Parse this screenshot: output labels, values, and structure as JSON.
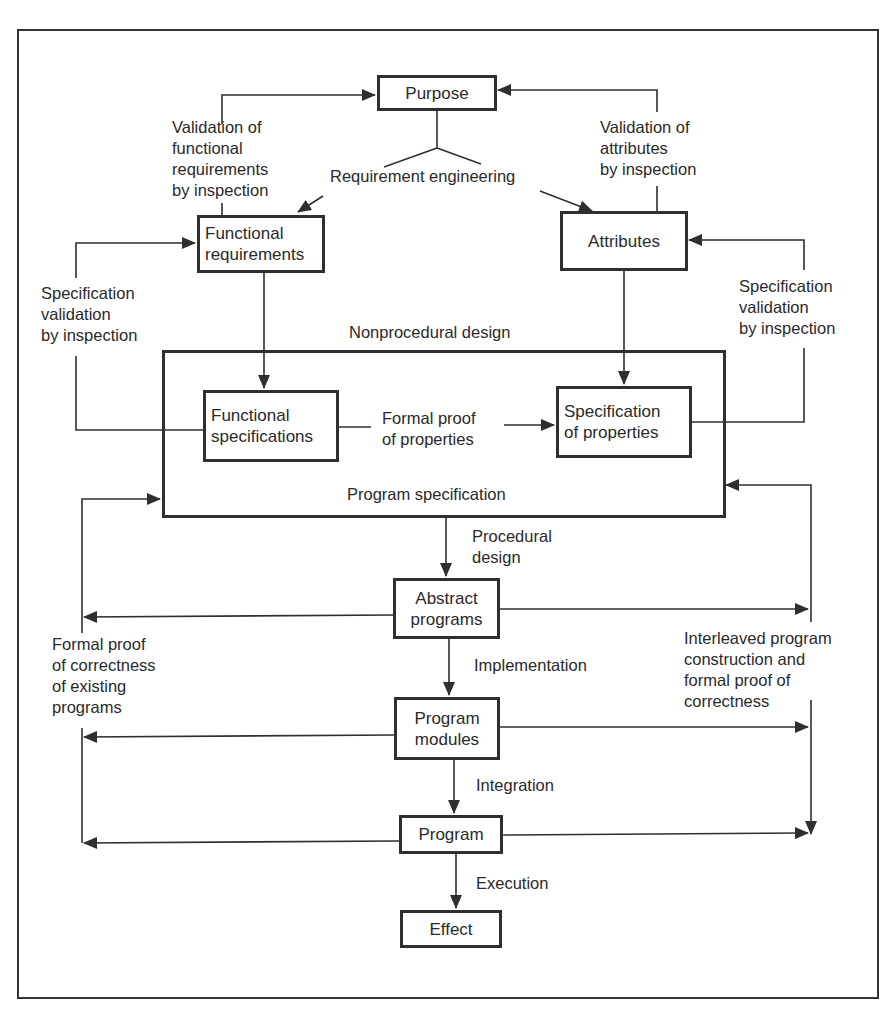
{
  "diagram": {
    "nodes": {
      "purpose": "Purpose",
      "functional_requirements": "Functional\nrequirements",
      "attributes": "Attributes",
      "functional_specifications": "Functional\nspecifications",
      "specification_of_properties": "Specification\nof properties",
      "abstract_programs": "Abstract\nprograms",
      "program_modules": "Program\nmodules",
      "program": "Program",
      "effect": "Effect"
    },
    "group": {
      "program_specification": "Program specification",
      "nonprocedural_design": "Nonprocedural design"
    },
    "labels": {
      "validation_functional": "Validation of\nfunctional\nrequirements\nby inspection",
      "validation_attributes": "Validation of\nattributes\nby inspection",
      "requirement_engineering": "Requirement engineering",
      "spec_validation_left": "Specification\nvalidation\nby inspection",
      "spec_validation_right": "Specification\nvalidation\nby inspection",
      "formal_proof_properties": "Formal proof\nof properties",
      "procedural_design": "Procedural\ndesign",
      "implementation": "Implementation",
      "integration": "Integration",
      "execution": "Execution",
      "formal_proof_existing": "Formal proof\nof correctness\nof existing\nprograms",
      "interleaved": "Interleaved program\nconstruction and\nformal proof of\ncorrectness"
    },
    "colors": {
      "ink": "#2f2f2f",
      "background": "#ffffff"
    }
  }
}
